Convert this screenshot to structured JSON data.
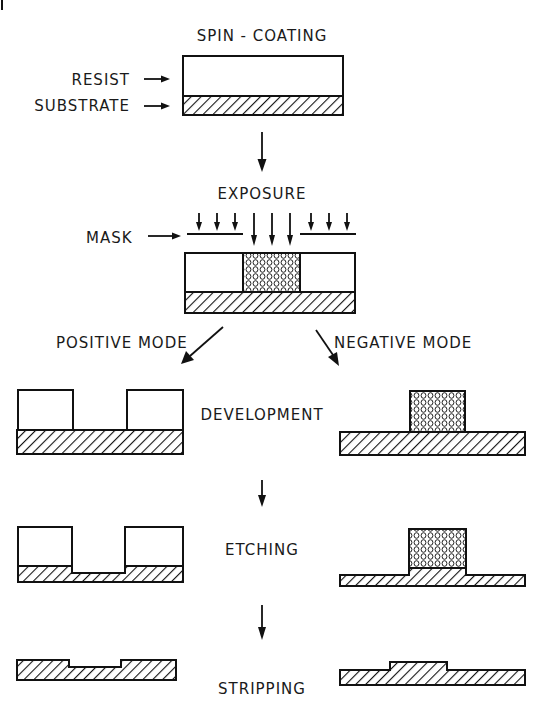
{
  "diagram": {
    "steps": {
      "spin_coating": "SPIN - COATING",
      "exposure": "EXPOSURE",
      "development": "DEVELOPMENT",
      "etching": "ETCHING",
      "stripping": "STRIPPING"
    },
    "labels": {
      "resist": "RESIST",
      "substrate": "SUBSTRATE",
      "mask": "MASK"
    },
    "branches": {
      "positive": "POSITIVE MODE",
      "negative": "NEGATIVE MODE"
    },
    "legend": {
      "substrate_pattern": "diagonal-hatch",
      "exposed_resist_pattern": "stippled-dots",
      "unexposed_resist_pattern": "blank"
    },
    "colors": {
      "ink": "#111111",
      "background": "#ffffff"
    }
  }
}
